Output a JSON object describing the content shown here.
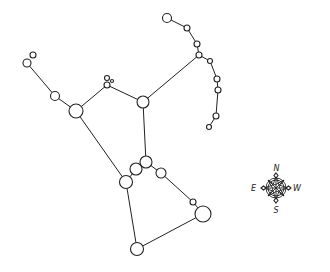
{
  "diagram": {
    "type": "constellation",
    "stroke_color": "#222222",
    "background": "#ffffff",
    "stars": [
      {
        "id": "s1",
        "x": 33,
        "y": 55,
        "r": 3
      },
      {
        "id": "s2",
        "x": 27,
        "y": 63,
        "r": 4
      },
      {
        "id": "s3",
        "x": 55,
        "y": 96,
        "r": 4.5
      },
      {
        "id": "s4",
        "x": 76,
        "y": 111,
        "r": 7
      },
      {
        "id": "s5",
        "x": 107,
        "y": 78,
        "r": 2.5
      },
      {
        "id": "s6",
        "x": 112,
        "y": 81,
        "r": 1.5
      },
      {
        "id": "s7",
        "x": 107,
        "y": 85,
        "r": 3
      },
      {
        "id": "s8",
        "x": 143,
        "y": 102,
        "r": 6
      },
      {
        "id": "s9",
        "x": 167,
        "y": 18,
        "r": 4.5
      },
      {
        "id": "s10",
        "x": 187,
        "y": 28,
        "r": 3
      },
      {
        "id": "s11",
        "x": 197,
        "y": 44,
        "r": 3
      },
      {
        "id": "s12",
        "x": 199,
        "y": 55,
        "r": 3
      },
      {
        "id": "s13",
        "x": 210,
        "y": 61,
        "r": 2.5
      },
      {
        "id": "s14",
        "x": 217,
        "y": 79,
        "r": 3
      },
      {
        "id": "s15",
        "x": 218,
        "y": 90,
        "r": 3
      },
      {
        "id": "s16",
        "x": 216,
        "y": 116,
        "r": 3
      },
      {
        "id": "s17",
        "x": 209,
        "y": 127,
        "r": 2.5
      },
      {
        "id": "s18",
        "x": 146,
        "y": 162,
        "r": 6
      },
      {
        "id": "s19",
        "x": 136,
        "y": 169,
        "r": 6
      },
      {
        "id": "s20",
        "x": 161,
        "y": 173,
        "r": 5
      },
      {
        "id": "s21",
        "x": 126,
        "y": 182,
        "r": 6.5
      },
      {
        "id": "s22",
        "x": 193,
        "y": 202,
        "r": 3
      },
      {
        "id": "s23",
        "x": 203,
        "y": 214,
        "r": 8
      },
      {
        "id": "s24",
        "x": 137,
        "y": 249,
        "r": 6.5
      }
    ],
    "edges": [
      [
        "s2",
        "s3"
      ],
      [
        "s3",
        "s4"
      ],
      [
        "s4",
        "s7"
      ],
      [
        "s7",
        "s8"
      ],
      [
        "s8",
        "s12"
      ],
      [
        "s9",
        "s10"
      ],
      [
        "s10",
        "s11"
      ],
      [
        "s11",
        "s12"
      ],
      [
        "s12",
        "s13"
      ],
      [
        "s13",
        "s14"
      ],
      [
        "s14",
        "s15"
      ],
      [
        "s15",
        "s16"
      ],
      [
        "s16",
        "s17"
      ],
      [
        "s4",
        "s21"
      ],
      [
        "s8",
        "s18"
      ],
      [
        "s18",
        "s19"
      ],
      [
        "s19",
        "s21"
      ],
      [
        "s18",
        "s20"
      ],
      [
        "s20",
        "s22"
      ],
      [
        "s22",
        "s23"
      ],
      [
        "s21",
        "s24"
      ],
      [
        "s24",
        "s23"
      ]
    ]
  },
  "compass": {
    "center_x": 276,
    "center_y": 188,
    "labels": {
      "north": "N",
      "south": "S",
      "east": "E",
      "west": "W"
    }
  }
}
